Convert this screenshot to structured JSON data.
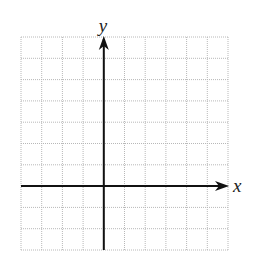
{
  "diagram": {
    "type": "coordinate-grid",
    "axes": {
      "x_label": "x",
      "y_label": "y"
    },
    "grid": {
      "columns": 10,
      "rows": 10,
      "left": 21,
      "top": 37,
      "right": 228,
      "bottom": 250,
      "line_color": "#b8b8b8",
      "y_axis_column": 4,
      "x_axis_row": 7
    },
    "colors": {
      "axis": "#111111",
      "background": "#ffffff"
    }
  }
}
